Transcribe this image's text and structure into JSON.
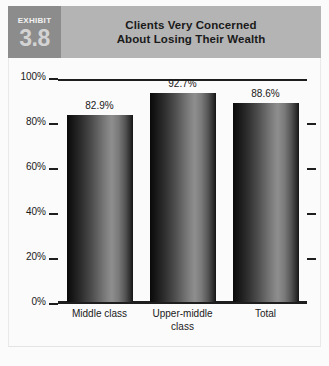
{
  "exhibit": {
    "label": "EXHIBIT",
    "number": "3.8"
  },
  "header": {
    "title_line1": "Clients Very Concerned",
    "title_line2": "About Losing Their Wealth"
  },
  "colors": {
    "header_band": "#b4b4b4",
    "badge": "#8c8c8c",
    "badge_number": "#d3d3d3",
    "axis": "#1e1e1e",
    "card_background": "#fbfbfb",
    "bar_dark": "#0a0a0a",
    "bar_highlight": "#8e8e8e"
  },
  "chart_data": {
    "type": "bar",
    "title": "Clients Very Concerned About Losing Their Wealth",
    "xlabel": "",
    "ylabel": "",
    "categories": [
      "Middle class",
      "Upper-middle class",
      "Total"
    ],
    "values": [
      82.9,
      92.7,
      88.6
    ],
    "value_labels": [
      "82.9%",
      "92.7%",
      "88.6%"
    ],
    "category_label_lines": [
      [
        "Middle class"
      ],
      [
        "Upper-middle",
        "class"
      ],
      [
        "Total"
      ]
    ],
    "ylim": [
      0,
      100
    ],
    "yticks": [
      0,
      20,
      40,
      60,
      80,
      100
    ],
    "ytick_labels": [
      "0%",
      "20%",
      "40%",
      "60%",
      "80%",
      "100%"
    ],
    "grid": false,
    "legend": false,
    "legend_position": "none"
  }
}
